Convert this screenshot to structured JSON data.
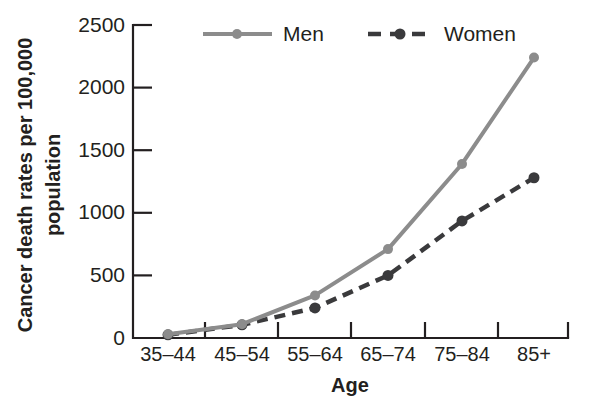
{
  "chart_data": {
    "type": "line",
    "title": "",
    "xlabel": "Age",
    "ylabel": "Cancer death rates per 100,000 population",
    "ylabel_line1": "Cancer death rates per 100,000",
    "ylabel_line2": "population",
    "categories": [
      "35–44",
      "45–54",
      "55–64",
      "65–74",
      "75–84",
      "85+"
    ],
    "series": [
      {
        "name": "Men",
        "values": [
          30,
          110,
          340,
          710,
          1390,
          2240
        ],
        "color": "#8c8c8c",
        "style": "solid",
        "marker": "circle"
      },
      {
        "name": "Women",
        "values": [
          25,
          105,
          240,
          500,
          935,
          1280
        ],
        "color": "#3a3a3c",
        "style": "dashed",
        "marker": "circle"
      }
    ],
    "ylim": [
      0,
      2500
    ],
    "yticks": [
      0,
      500,
      1000,
      1500,
      2000,
      2500
    ],
    "ytick_labels": [
      "0",
      "500",
      "1000",
      "1500",
      "2000",
      "2500"
    ],
    "grid": false,
    "legend_position": "top-center"
  },
  "axes": {
    "y_title_line1": "Cancer death rates per 100,000",
    "y_title_line2": "population",
    "x_title": "Age"
  },
  "legend": {
    "items": [
      {
        "label": "Men"
      },
      {
        "label": "Women"
      }
    ]
  },
  "colors": {
    "men": "#8c8c8c",
    "women": "#3a3a3c",
    "axis": "#231f20",
    "background": "#ffffff"
  }
}
